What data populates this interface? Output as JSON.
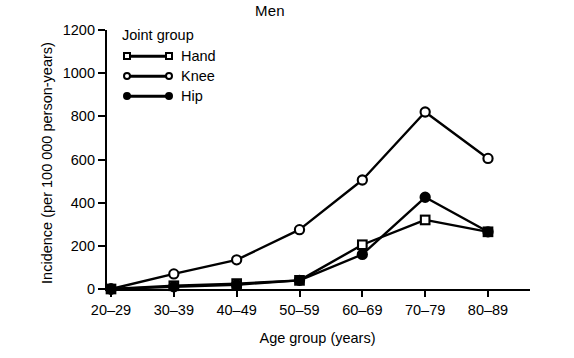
{
  "chart_data": {
    "type": "line",
    "title": "Men",
    "xlabel": "Age group (years)",
    "ylabel": "Incidence (per 100 000 person-years)",
    "categories": [
      "20–29",
      "30–39",
      "40–49",
      "50–59",
      "60–69",
      "70–79",
      "80–89"
    ],
    "yticks": [
      0,
      200,
      400,
      600,
      800,
      1000,
      1200
    ],
    "ylim": [
      0,
      1200
    ],
    "grid": false,
    "legend_title": "Joint group",
    "legend_position": "upper-left-inside",
    "series": [
      {
        "name": "Hand",
        "marker": "open-square",
        "color": "#000000",
        "values": [
          0,
          15,
          25,
          40,
          205,
          320,
          265
        ]
      },
      {
        "name": "Knee",
        "marker": "open-circle",
        "color": "#000000",
        "values": [
          0,
          70,
          135,
          275,
          505,
          820,
          605
        ]
      },
      {
        "name": "Hip",
        "marker": "filled-circle",
        "color": "#000000",
        "values": [
          0,
          10,
          20,
          40,
          160,
          425,
          265
        ]
      }
    ]
  }
}
